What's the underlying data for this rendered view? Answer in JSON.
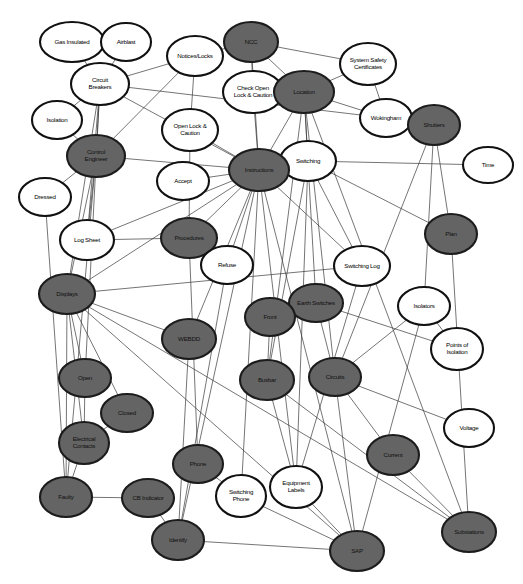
{
  "diagram": {
    "type": "concept-network-graph",
    "title": "",
    "background_color": "#ffffff",
    "node_fill_dark": "#646464",
    "node_fill_light": "#ffffff",
    "node_stroke": "#111111",
    "edge_color": "#3a3a3a",
    "node_count": 45,
    "edge_count": 72,
    "nodes": [
      {
        "id": "gas-insulated",
        "label": "Gas Insulated",
        "lines": [
          "Gas Insulated"
        ],
        "x": 72,
        "y": 42,
        "rx": 32,
        "ry": 20,
        "shade": "light"
      },
      {
        "id": "airblast",
        "label": "Airblast",
        "lines": [
          "Airblast"
        ],
        "x": 126,
        "y": 42,
        "rx": 25,
        "ry": 19,
        "shade": "light"
      },
      {
        "id": "notices-locks",
        "label": "Notices/Locks",
        "lines": [
          "Notices/Locks"
        ],
        "x": 195,
        "y": 56,
        "rx": 28,
        "ry": 20,
        "shade": "light"
      },
      {
        "id": "ncc",
        "label": "NCC",
        "lines": [
          "NCC"
        ],
        "x": 251,
        "y": 42,
        "rx": 27,
        "ry": 20,
        "shade": "dark"
      },
      {
        "id": "system-safety-certs",
        "label": "System Safety Certificates",
        "lines": [
          "System Safety",
          "Certificates"
        ],
        "x": 368,
        "y": 64,
        "rx": 28,
        "ry": 21,
        "shade": "light"
      },
      {
        "id": "circuit-breakers",
        "label": "Circuit Breakers",
        "lines": [
          "Circuit",
          "Breakers"
        ],
        "x": 100,
        "y": 84,
        "rx": 29,
        "ry": 21,
        "shade": "light"
      },
      {
        "id": "check-open-lock",
        "label": "Check Open Lock & Caution",
        "lines": [
          "Check Open",
          "Lock & Caution"
        ],
        "x": 253,
        "y": 92,
        "rx": 30,
        "ry": 21,
        "shade": "light"
      },
      {
        "id": "location",
        "label": "Location",
        "lines": [
          "Location"
        ],
        "x": 304,
        "y": 92,
        "rx": 30,
        "ry": 21,
        "shade": "dark"
      },
      {
        "id": "wokingham",
        "label": "Wokingham",
        "lines": [
          "Wokingham"
        ],
        "x": 386,
        "y": 118,
        "rx": 26,
        "ry": 19,
        "shade": "light"
      },
      {
        "id": "isolation",
        "label": "Isolation",
        "lines": [
          "Isolation"
        ],
        "x": 57,
        "y": 120,
        "rx": 25,
        "ry": 19,
        "shade": "light"
      },
      {
        "id": "shutters",
        "label": "Shutters",
        "lines": [
          "Shutters"
        ],
        "x": 434,
        "y": 125,
        "rx": 26,
        "ry": 20,
        "shade": "dark"
      },
      {
        "id": "open-lock-caution",
        "label": "Open Lock & Caution",
        "lines": [
          "Open Lock &",
          "Caution"
        ],
        "x": 190,
        "y": 130,
        "rx": 28,
        "ry": 21,
        "shade": "light"
      },
      {
        "id": "control-engineer",
        "label": "Control Engineer",
        "lines": [
          "Control",
          "Engineer"
        ],
        "x": 96,
        "y": 156,
        "rx": 29,
        "ry": 21,
        "shade": "dark"
      },
      {
        "id": "switching",
        "label": "Switching",
        "lines": [
          "Switching"
        ],
        "x": 308,
        "y": 161,
        "rx": 28,
        "ry": 20,
        "shade": "light"
      },
      {
        "id": "time",
        "label": "Time",
        "lines": [
          "Time"
        ],
        "x": 488,
        "y": 165,
        "rx": 25,
        "ry": 18,
        "shade": "light"
      },
      {
        "id": "instructions",
        "label": "Instructions",
        "lines": [
          "Instructions"
        ],
        "x": 259,
        "y": 170,
        "rx": 30,
        "ry": 21,
        "shade": "dark"
      },
      {
        "id": "accept",
        "label": "Accept",
        "lines": [
          "Accept"
        ],
        "x": 183,
        "y": 181,
        "rx": 26,
        "ry": 19,
        "shade": "light"
      },
      {
        "id": "dressed",
        "label": "Dressed",
        "lines": [
          "Dressed"
        ],
        "x": 45,
        "y": 197,
        "rx": 26,
        "ry": 19,
        "shade": "light"
      },
      {
        "id": "procedures",
        "label": "Procedures",
        "lines": [
          "Procedures"
        ],
        "x": 189,
        "y": 238,
        "rx": 28,
        "ry": 20,
        "shade": "dark"
      },
      {
        "id": "log-sheet",
        "label": "Log Sheet",
        "lines": [
          "Log Sheet"
        ],
        "x": 87,
        "y": 240,
        "rx": 27,
        "ry": 20,
        "shade": "light"
      },
      {
        "id": "plan",
        "label": "Plan",
        "lines": [
          "Plan"
        ],
        "x": 451,
        "y": 234,
        "rx": 26,
        "ry": 20,
        "shade": "dark"
      },
      {
        "id": "refuse",
        "label": "Refuse",
        "lines": [
          "Refuse"
        ],
        "x": 227,
        "y": 265,
        "rx": 26,
        "ry": 19,
        "shade": "light"
      },
      {
        "id": "switching-log",
        "label": "Switching Log",
        "lines": [
          "Switching Log"
        ],
        "x": 362,
        "y": 266,
        "rx": 28,
        "ry": 20,
        "shade": "light"
      },
      {
        "id": "displays",
        "label": "Displays",
        "lines": [
          "Displays"
        ],
        "x": 67,
        "y": 294,
        "rx": 28,
        "ry": 20,
        "shade": "dark"
      },
      {
        "id": "earth-switches",
        "label": "Earth Switches",
        "lines": [
          "Earth Switches"
        ],
        "x": 316,
        "y": 303,
        "rx": 27,
        "ry": 19,
        "shade": "dark"
      },
      {
        "id": "isolators",
        "label": "Isolators",
        "lines": [
          "Isolators"
        ],
        "x": 424,
        "y": 306,
        "rx": 26,
        "ry": 19,
        "shade": "light"
      },
      {
        "id": "front",
        "label": "Front",
        "lines": [
          "Front"
        ],
        "x": 270,
        "y": 317,
        "rx": 25,
        "ry": 19,
        "shade": "dark"
      },
      {
        "id": "webdd",
        "label": "WEBDD",
        "lines": [
          "WEBDD"
        ],
        "x": 189,
        "y": 339,
        "rx": 27,
        "ry": 20,
        "shade": "dark"
      },
      {
        "id": "points-of-isolation",
        "label": "Points of Isolation",
        "lines": [
          "Points of",
          "Isolation"
        ],
        "x": 457,
        "y": 349,
        "rx": 26,
        "ry": 21,
        "shade": "light"
      },
      {
        "id": "busbar",
        "label": "Busbar",
        "lines": [
          "Busbar"
        ],
        "x": 267,
        "y": 380,
        "rx": 27,
        "ry": 20,
        "shade": "dark"
      },
      {
        "id": "circuits",
        "label": "Circuits",
        "lines": [
          "Circuits"
        ],
        "x": 335,
        "y": 377,
        "rx": 26,
        "ry": 19,
        "shade": "dark"
      },
      {
        "id": "open",
        "label": "Open",
        "lines": [
          "Open"
        ],
        "x": 85,
        "y": 378,
        "rx": 26,
        "ry": 19,
        "shade": "dark"
      },
      {
        "id": "voltage",
        "label": "Voltage",
        "lines": [
          "Voltage"
        ],
        "x": 469,
        "y": 428,
        "rx": 25,
        "ry": 19,
        "shade": "light"
      },
      {
        "id": "closed",
        "label": "Closed",
        "lines": [
          "Closed"
        ],
        "x": 127,
        "y": 413,
        "rx": 26,
        "ry": 19,
        "shade": "dark"
      },
      {
        "id": "electrical-contacts",
        "label": "Electrical Contacts",
        "lines": [
          "Electrical",
          "Contacts"
        ],
        "x": 84,
        "y": 443,
        "rx": 25,
        "ry": 21,
        "shade": "dark"
      },
      {
        "id": "current",
        "label": "Current",
        "lines": [
          "Current"
        ],
        "x": 393,
        "y": 455,
        "rx": 26,
        "ry": 20,
        "shade": "dark"
      },
      {
        "id": "phone",
        "label": "Phone",
        "lines": [
          "Phone"
        ],
        "x": 198,
        "y": 464,
        "rx": 25,
        "ry": 19,
        "shade": "dark"
      },
      {
        "id": "equipment-labels",
        "label": "Equipment Labels",
        "lines": [
          "Equipment",
          "Labels"
        ],
        "x": 296,
        "y": 487,
        "rx": 26,
        "ry": 21,
        "shade": "light"
      },
      {
        "id": "faulty",
        "label": "Faulty",
        "lines": [
          "Faulty"
        ],
        "x": 66,
        "y": 497,
        "rx": 26,
        "ry": 20,
        "shade": "dark"
      },
      {
        "id": "cb-indicator",
        "label": "CB Indicator",
        "lines": [
          "CB Indicator"
        ],
        "x": 148,
        "y": 498,
        "rx": 26,
        "ry": 19,
        "shade": "dark"
      },
      {
        "id": "switching-phone",
        "label": "Switching Phone",
        "lines": [
          "Switching",
          "Phone"
        ],
        "x": 241,
        "y": 496,
        "rx": 25,
        "ry": 21,
        "shade": "light"
      },
      {
        "id": "substations",
        "label": "Substations",
        "lines": [
          "Substations"
        ],
        "x": 469,
        "y": 532,
        "rx": 27,
        "ry": 20,
        "shade": "dark"
      },
      {
        "id": "identify",
        "label": "Identify",
        "lines": [
          "Identify"
        ],
        "x": 178,
        "y": 540,
        "rx": 26,
        "ry": 20,
        "shade": "dark"
      },
      {
        "id": "sap",
        "label": "SAP",
        "lines": [
          "SAP"
        ],
        "x": 357,
        "y": 551,
        "rx": 27,
        "ry": 20,
        "shade": "dark"
      },
      {
        "id": "cb-type-hub",
        "label": "",
        "lines": [],
        "x": -100,
        "y": -100,
        "rx": 0,
        "ry": 0,
        "shade": "light"
      }
    ],
    "edges": [
      {
        "from": "gas-insulated",
        "to": "circuit-breakers"
      },
      {
        "from": "airblast",
        "to": "circuit-breakers"
      },
      {
        "from": "circuit-breakers",
        "to": "isolation"
      },
      {
        "from": "circuit-breakers",
        "to": "control-engineer"
      },
      {
        "from": "circuit-breakers",
        "to": "notices-locks"
      },
      {
        "from": "circuit-breakers",
        "to": "instructions"
      },
      {
        "from": "circuit-breakers",
        "to": "wokingham"
      },
      {
        "from": "circuit-breakers",
        "to": "log-sheet"
      },
      {
        "from": "circuit-breakers",
        "to": "displays"
      },
      {
        "from": "circuit-breakers",
        "to": "open"
      },
      {
        "from": "notices-locks",
        "to": "open-lock-caution"
      },
      {
        "from": "notices-locks",
        "to": "ncc"
      },
      {
        "from": "notices-locks",
        "to": "control-engineer"
      },
      {
        "from": "ncc",
        "to": "check-open-lock"
      },
      {
        "from": "ncc",
        "to": "location"
      },
      {
        "from": "ncc",
        "to": "system-safety-certs"
      },
      {
        "from": "ncc",
        "to": "instructions"
      },
      {
        "from": "location",
        "to": "system-safety-certs"
      },
      {
        "from": "location",
        "to": "wokingham"
      },
      {
        "from": "location",
        "to": "switching"
      },
      {
        "from": "location",
        "to": "instructions"
      },
      {
        "from": "location",
        "to": "busbar"
      },
      {
        "from": "location",
        "to": "circuits"
      },
      {
        "from": "location",
        "to": "earth-switches"
      },
      {
        "from": "location",
        "to": "substations"
      },
      {
        "from": "system-safety-certs",
        "to": "wokingham"
      },
      {
        "from": "check-open-lock",
        "to": "instructions"
      },
      {
        "from": "open-lock-caution",
        "to": "instructions"
      },
      {
        "from": "open-lock-caution",
        "to": "procedures"
      },
      {
        "from": "control-engineer",
        "to": "dressed"
      },
      {
        "from": "control-engineer",
        "to": "log-sheet"
      },
      {
        "from": "control-engineer",
        "to": "instructions"
      },
      {
        "from": "control-engineer",
        "to": "displays"
      },
      {
        "from": "control-engineer",
        "to": "faulty"
      },
      {
        "from": "instructions",
        "to": "switching"
      },
      {
        "from": "instructions",
        "to": "accept"
      },
      {
        "from": "instructions",
        "to": "refuse"
      },
      {
        "from": "instructions",
        "to": "procedures"
      },
      {
        "from": "instructions",
        "to": "log-sheet"
      },
      {
        "from": "instructions",
        "to": "switching-log"
      },
      {
        "from": "instructions",
        "to": "equipment-labels"
      },
      {
        "from": "instructions",
        "to": "switching-phone"
      },
      {
        "from": "instructions",
        "to": "identify"
      },
      {
        "from": "instructions",
        "to": "sap"
      },
      {
        "from": "instructions",
        "to": "displays"
      },
      {
        "from": "instructions",
        "to": "webdd"
      },
      {
        "from": "switching",
        "to": "time"
      },
      {
        "from": "switching",
        "to": "plan"
      },
      {
        "from": "switching",
        "to": "switching-log"
      },
      {
        "from": "switching",
        "to": "equipment-labels"
      },
      {
        "from": "switching",
        "to": "busbar"
      },
      {
        "from": "shutters",
        "to": "plan"
      },
      {
        "from": "shutters",
        "to": "circuits"
      },
      {
        "from": "shutters",
        "to": "isolators"
      },
      {
        "from": "dressed",
        "to": "faulty"
      },
      {
        "from": "displays",
        "to": "open"
      },
      {
        "from": "displays",
        "to": "closed"
      },
      {
        "from": "displays",
        "to": "electrical-contacts"
      },
      {
        "from": "displays",
        "to": "faulty"
      },
      {
        "from": "displays",
        "to": "webdd"
      },
      {
        "from": "displays",
        "to": "switching-log"
      },
      {
        "from": "displays",
        "to": "substations"
      },
      {
        "from": "displays",
        "to": "sap"
      },
      {
        "from": "open",
        "to": "electrical-contacts"
      },
      {
        "from": "closed",
        "to": "electrical-contacts"
      },
      {
        "from": "electrical-contacts",
        "to": "faulty"
      },
      {
        "from": "faulty",
        "to": "cb-indicator"
      },
      {
        "from": "cb-indicator",
        "to": "identify"
      },
      {
        "from": "identify",
        "to": "sap"
      },
      {
        "from": "front",
        "to": "busbar"
      },
      {
        "from": "front",
        "to": "earth-switches"
      },
      {
        "from": "earth-switches",
        "to": "circuits"
      },
      {
        "from": "earth-switches",
        "to": "points-of-isolation"
      },
      {
        "from": "isolators",
        "to": "points-of-isolation"
      },
      {
        "from": "isolators",
        "to": "circuits"
      },
      {
        "from": "isolators",
        "to": "sap"
      },
      {
        "from": "circuits",
        "to": "voltage"
      },
      {
        "from": "circuits",
        "to": "current"
      },
      {
        "from": "circuits",
        "to": "sap"
      },
      {
        "from": "busbar",
        "to": "equipment-labels"
      },
      {
        "from": "busbar",
        "to": "substations"
      },
      {
        "from": "phone",
        "to": "switching-phone"
      },
      {
        "from": "switching-phone",
        "to": "sap"
      },
      {
        "from": "equipment-labels",
        "to": "sap"
      },
      {
        "from": "current",
        "to": "substations"
      },
      {
        "from": "plan",
        "to": "substations"
      },
      {
        "from": "webdd",
        "to": "identify"
      },
      {
        "from": "procedures",
        "to": "phone"
      },
      {
        "from": "refuse",
        "to": "identify"
      },
      {
        "from": "switching-log",
        "to": "equipment-labels"
      },
      {
        "from": "log-sheet",
        "to": "procedures"
      },
      {
        "from": "isolation",
        "to": "control-engineer"
      }
    ]
  }
}
